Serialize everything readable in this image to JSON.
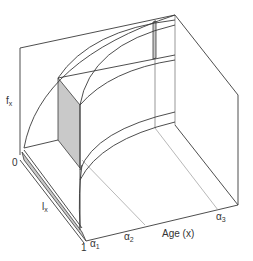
{
  "diagram": {
    "type": "3d-surface-line-drawing",
    "axes": {
      "vertical": {
        "label": "f",
        "subscript": "x"
      },
      "depth": {
        "label": "l",
        "subscript": "x",
        "start_label": "0",
        "end_label": "1"
      },
      "horizontal": {
        "label": "Age (x)"
      }
    },
    "age_marks": [
      {
        "label": "α",
        "subscript": "1"
      },
      {
        "label": "α",
        "subscript": "2"
      },
      {
        "label": "α",
        "subscript": "3"
      }
    ],
    "colors": {
      "line": "#3a3a3a",
      "shade": "#c9c9c9",
      "background": "#ffffff"
    }
  }
}
